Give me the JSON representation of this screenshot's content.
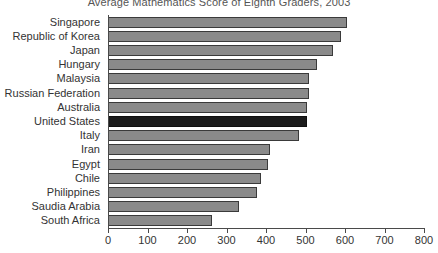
{
  "chart_data": {
    "type": "bar",
    "orientation": "horizontal",
    "title": "Average Mathematics Score of Eighth Graders, 2003",
    "xlabel": "",
    "ylabel": "",
    "xlim": [
      0,
      800
    ],
    "xticks": [
      0,
      100,
      200,
      300,
      400,
      500,
      600,
      700,
      800
    ],
    "xtick_labels": [
      "0",
      "100",
      "200",
      "300",
      "400",
      "500",
      "600",
      "700",
      "800"
    ],
    "grid": false,
    "legend": "none",
    "categories": [
      "Singapore",
      "Republic of Korea",
      "Japan",
      "Hungary",
      "Malaysia",
      "Russian Federation",
      "Australia",
      "United States",
      "Italy",
      "Iran",
      "Egypt",
      "Chile",
      "Philippines",
      "Saudia Arabia",
      "South Africa"
    ],
    "values": [
      605,
      589,
      570,
      529,
      508,
      508,
      505,
      504,
      484,
      411,
      406,
      387,
      378,
      332,
      264
    ],
    "highlight_category": "United States",
    "colors": {
      "bar_fill": "#8a8a8a",
      "bar_edge": "#3a3a3a",
      "highlight_fill": "#1c1c1c",
      "highlight_edge": "#101010",
      "axis": "#4a4a4a",
      "background": "#ffffff",
      "text": "#333333",
      "title_text": "#555555"
    }
  }
}
